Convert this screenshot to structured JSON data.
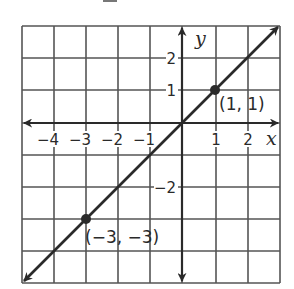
{
  "chart_data": {
    "type": "line",
    "title": "",
    "xlabel": "x",
    "ylabel": "y",
    "xlim": [
      -5,
      3
    ],
    "ylim": [
      -5,
      3
    ],
    "grid": true,
    "x_ticks_labeled": [
      -4,
      -3,
      -2,
      -1,
      1,
      2
    ],
    "y_ticks_labeled": [
      2,
      1,
      -2
    ],
    "x_tick_labels": [
      "−4",
      "−3",
      "−2",
      "−1",
      "1",
      "2"
    ],
    "y_tick_labels": [
      "2",
      "1",
      "−2"
    ],
    "series": [
      {
        "name": "y = x",
        "equation": "y = x",
        "x": [
          -5,
          3
        ],
        "y": [
          -5,
          3
        ],
        "arrows_both_ends": true
      }
    ],
    "points": [
      {
        "x": 1,
        "y": 1,
        "label": "(1, 1)"
      },
      {
        "x": -3,
        "y": -3,
        "label": "(−3, −3)"
      }
    ],
    "legend": null
  },
  "labels": {
    "x_axis": "x",
    "y_axis": "y",
    "point_a": "(1, 1)",
    "point_b": "(−3, −3)",
    "xt": [
      "−4",
      "−3",
      "−2",
      "−1",
      "1",
      "2"
    ],
    "yt": [
      "2",
      "1",
      "−2"
    ]
  },
  "colors": {
    "ink": "#2a2a2a",
    "grid": "#555555",
    "background": "#ffffff"
  }
}
